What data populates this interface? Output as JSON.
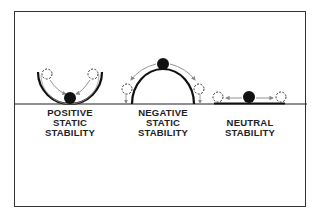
{
  "diagram": {
    "type": "static-stability-illustration",
    "panels": [
      {
        "id": "positive",
        "label_lines": [
          "POSITIVE",
          "STATIC",
          "STABILITY"
        ],
        "surface": "concave-bowl"
      },
      {
        "id": "negative",
        "label_lines": [
          "NEGATIVE",
          "STATIC",
          "STABILITY"
        ],
        "surface": "convex-dome"
      },
      {
        "id": "neutral",
        "label_lines": [
          "NEUTRAL",
          "STABILITY"
        ],
        "surface": "flat"
      }
    ],
    "colors": {
      "line": "#1a1a1a",
      "ball": "#111111",
      "arrow": "#888888",
      "background": "#ffffff"
    }
  }
}
